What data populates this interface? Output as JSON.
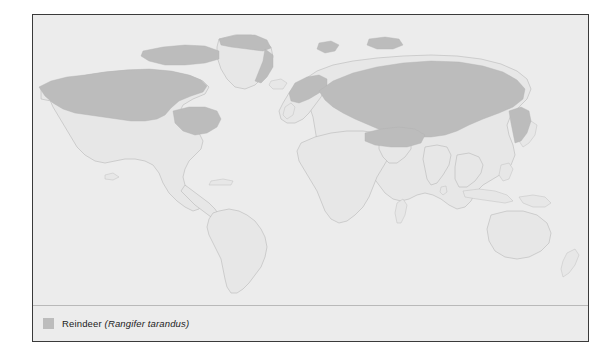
{
  "figure": {
    "frame_color": "#3a3a3a",
    "background_color": "#ececec"
  },
  "map": {
    "projection_label": "world",
    "ocean_color": "#ececec",
    "land_color": "#e7e7e7",
    "coastline_color": "#b4b4b4",
    "range_color": "#bcbcbc"
  },
  "legend": {
    "swatch_color": "#bcbcbc",
    "common_name": "Reindeer",
    "scientific_name": "(Rangifer tarandus)"
  }
}
